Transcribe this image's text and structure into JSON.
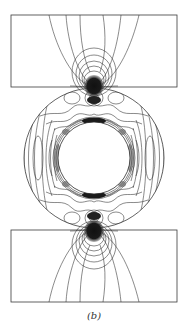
{
  "figure": {
    "caption": "(b)",
    "colors": {
      "line": "#2a2a2a",
      "fill_dark": "#1a1a1a",
      "background": "#ffffff"
    },
    "geometry": {
      "top_block": {
        "x": 11,
        "y": 15,
        "w": 166,
        "h": 72
      },
      "bottom_block": {
        "x": 11,
        "y": 230,
        "w": 166,
        "h": 72
      },
      "outer_circle": {
        "cx": 94,
        "cy": 158,
        "r": 70
      },
      "inner_circle": {
        "cx": 94,
        "cy": 158,
        "r": 36
      }
    }
  }
}
